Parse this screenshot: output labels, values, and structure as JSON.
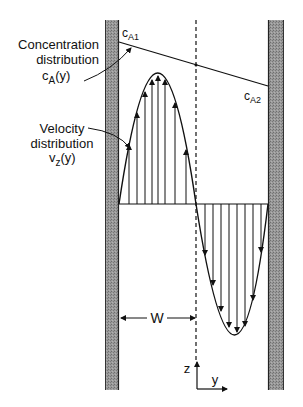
{
  "labels": {
    "concentration_line1": "Concentration",
    "concentration_line2": "distribution",
    "concentration_symbol": "c",
    "concentration_sub": "A",
    "concentration_arg": "(y)",
    "velocity_line1": "Velocity",
    "velocity_line2": "distribution",
    "velocity_symbol": "v",
    "velocity_sub": "z",
    "velocity_arg": "(y)",
    "cA1_symbol": "c",
    "cA1_sub": "A1",
    "cA2_symbol": "c",
    "cA2_sub": "A2",
    "half_width": "W",
    "axis_z": "z",
    "axis_y": "y"
  },
  "colors": {
    "wall_fill": "#8a8a8a",
    "wall_edge": "#333333",
    "line": "#111111"
  },
  "geometry": {
    "left_wall": {
      "x": 105,
      "width": 14,
      "y_top": 20,
      "y_bottom": 390
    },
    "right_wall": {
      "x": 268,
      "width": 16,
      "y_top": 20,
      "y_bottom": 390
    },
    "centerline_x": 196,
    "baseline_y": 204,
    "concentration_line": {
      "x1": 119,
      "y1": 42,
      "x2": 268,
      "y2": 86
    },
    "positive_lobe": {
      "x_start": 119,
      "x_end": 196,
      "peak_x": 158,
      "peak_y": 73
    },
    "negative_lobe": {
      "x_start": 196,
      "x_end": 268,
      "trough_x": 237,
      "trough_y": 335
    },
    "up_arrows_x": [
      129,
      137,
      145,
      152,
      158,
      165,
      173,
      183
    ],
    "down_arrows_x": [
      205,
      213,
      221,
      229,
      237,
      245,
      253,
      261
    ],
    "w_arrow": {
      "x1": 120,
      "x2": 195,
      "y": 318
    },
    "axes_origin": {
      "x": 197,
      "y": 389
    },
    "axis_z_end_y": 362,
    "axis_y_end_x": 227
  }
}
